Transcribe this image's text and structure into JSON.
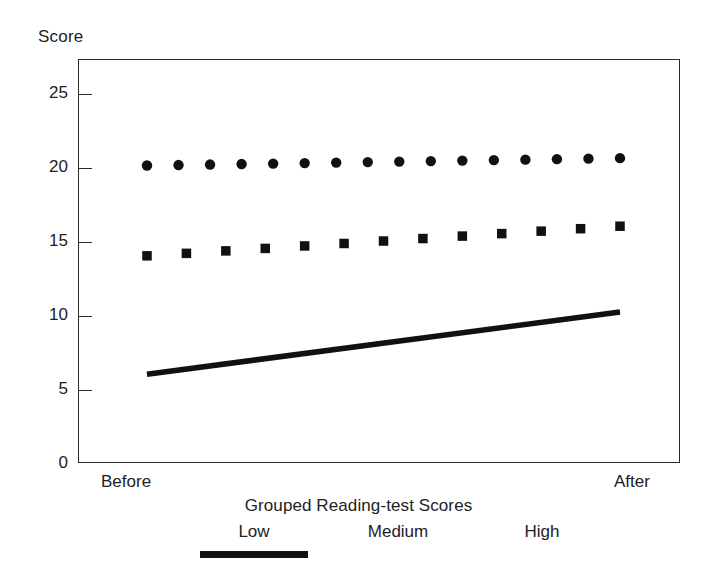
{
  "chart_data": {
    "type": "line",
    "title": "",
    "subtitle": "",
    "xlabel": "",
    "ylabel": "Score",
    "x": [
      "Before",
      "After"
    ],
    "xtick_labels": [
      "Before",
      "After"
    ],
    "ytick_labels": [
      "0",
      "5",
      "10",
      "15",
      "20",
      "25"
    ],
    "ytick_values": [
      0,
      5,
      10,
      15,
      20,
      25
    ],
    "ylim": [
      0,
      27.3
    ],
    "grid": false,
    "legend_position": "bottom",
    "legend_title": "Grouped Reading-test Scores",
    "series": [
      {
        "name": "Low",
        "style": "solid-line",
        "marker": "none",
        "color": "#111111",
        "values": [
          6.0,
          10.2
        ],
        "endpoints": {
          "before": 6.0,
          "after": 10.2
        }
      },
      {
        "name": "Medium",
        "style": "square-markers",
        "marker": "square",
        "color": "#111111",
        "values": [
          14.0,
          16.0
        ],
        "endpoints": {
          "before": 14.0,
          "after": 16.0
        },
        "marker_count": 13
      },
      {
        "name": "High",
        "style": "round-markers",
        "marker": "circle",
        "color": "#111111",
        "values": [
          20.1,
          20.6
        ],
        "endpoints": {
          "before": 20.1,
          "after": 20.6
        },
        "marker_count": 16
      }
    ]
  },
  "axes": {
    "y_title": "Score",
    "y_ticks": [
      {
        "label": "25",
        "value": 25
      },
      {
        "label": "20",
        "value": 20
      },
      {
        "label": "15",
        "value": 15
      },
      {
        "label": "10",
        "value": 10
      },
      {
        "label": "5",
        "value": 5
      },
      {
        "label": "0",
        "value": 0
      }
    ],
    "x_left_label": "Before",
    "x_right_label": "After"
  },
  "legend": {
    "title": "Grouped Reading-test Scores",
    "entries": [
      {
        "label": "Low",
        "swatch": "solid-line-swatch"
      },
      {
        "label": "Medium",
        "swatch": "square-dots-swatch"
      },
      {
        "label": "High",
        "swatch": "round-dots-swatch"
      }
    ]
  },
  "colors": {
    "ink": "#111111",
    "frame": "#2b2b2b",
    "background": "#ffffff"
  }
}
